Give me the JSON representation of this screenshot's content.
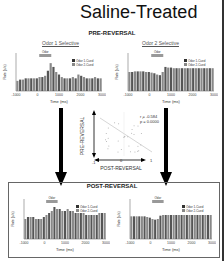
{
  "title": "Saline-Treated",
  "pre": {
    "label": "PRE-REVERSAL",
    "left_title": "Odor 1 Selective",
    "right_title": "Odor 2 Selective"
  },
  "post": {
    "label": "POST-REVERSAL"
  },
  "legend": {
    "odor": "Odor",
    "s1": "Odor 1-Cued",
    "s2": "Odor 2-Cued"
  },
  "axes": {
    "ylabel": "Rate (s/s)",
    "xlabel": "Time (ms)",
    "xticks": [
      "-1000",
      "0",
      "1000",
      "2000",
      "3000"
    ]
  },
  "scatter": {
    "r": "r = -0.584",
    "p": "p = 0.0000",
    "ylabel": "PRE-REVERSAL",
    "xlabel": "POST-REVERSAL",
    "xticks": [
      "-1",
      "0",
      "1"
    ],
    "yticks": [
      "1",
      "0",
      "-1"
    ]
  },
  "chart_data": [
    {
      "type": "bar",
      "title": "Pre-Reversal Odor 1 Selective",
      "xlabel": "Time (ms)",
      "ylabel": "Rate (s/s)",
      "xlim": [
        -1000,
        3000
      ],
      "ylim": [
        0,
        3
      ],
      "series": [
        {
          "name": "Odor 1-Cued",
          "values": [
            0.8,
            0.9,
            0.9,
            1,
            1,
            1,
            1,
            1,
            1.1,
            1.1,
            1.2,
            1.6,
            2.2,
            1.9,
            1.5,
            1.3,
            1.1,
            1,
            1,
            1,
            1.1,
            1,
            1.3,
            1.2,
            1.1,
            1,
            1,
            1,
            1.1,
            1,
            1
          ]
        }
      ]
    },
    {
      "type": "bar",
      "title": "Pre-Reversal Odor 2 Selective",
      "xlabel": "Time (ms)",
      "ylabel": "Rate (s/s)",
      "xlim": [
        -1000,
        3000
      ],
      "ylim": [
        0,
        6
      ],
      "series": [
        {
          "name": "Odor 2-Cued",
          "values": [
            3,
            3,
            3.1,
            3.1,
            3.1,
            3.1,
            3,
            3,
            2.9,
            2.8,
            2.6,
            2.5,
            3,
            3.8,
            3.7,
            3.7,
            3.6,
            3.6,
            3.6,
            3.6,
            3.6,
            3.6,
            3.6,
            3.6,
            3.6,
            3.6,
            3.6,
            3.6,
            3.6,
            3.6,
            3.6
          ]
        }
      ]
    },
    {
      "type": "bar",
      "title": "Post-Reversal Odor 1 Selective",
      "xlabel": "Time (ms)",
      "ylabel": "Rate (s/s)",
      "xlim": [
        -1000,
        3000
      ],
      "ylim": [
        0,
        2
      ],
      "series": [
        {
          "name": "Odor 1-Cued",
          "values": [
            1,
            1.1,
            1.1,
            1.1,
            1,
            1,
            1,
            1.1,
            1.2,
            1.3,
            1.4,
            1.6,
            1.5,
            1.5,
            1.4,
            1.4,
            1.5,
            1.4,
            1.4,
            1.3,
            1.3,
            1.3,
            1.3,
            1.2,
            1.2,
            1.2,
            1.2,
            1.2,
            1.3,
            1.3,
            1.3
          ]
        }
      ]
    },
    {
      "type": "bar",
      "title": "Post-Reversal Odor 2 Selective",
      "xlabel": "Time (ms)",
      "ylabel": "Rate (s/s)",
      "xlim": [
        -1000,
        3000
      ],
      "ylim": [
        0,
        6
      ],
      "series": [
        {
          "name": "Odor 2-Cued",
          "values": [
            3.4,
            3.4,
            3.4,
            3.4,
            3.4,
            3.4,
            3.3,
            3.2,
            3,
            2.9,
            3,
            3.5,
            3.6,
            3.6,
            3.6,
            3.6,
            3.6,
            3.6,
            3.6,
            3.6,
            3.6,
            3.6,
            3.6,
            3.6,
            3.6,
            3.6,
            3.6,
            3.6,
            3.6,
            3.6,
            3.6
          ]
        }
      ]
    },
    {
      "type": "scatter",
      "title": "Selectivity correlation",
      "xlabel": "POST-REVERSAL",
      "ylabel": "PRE-REVERSAL",
      "xlim": [
        -1,
        1
      ],
      "ylim": [
        -1,
        1
      ],
      "annotations": [
        "r = -0.584",
        "p = 0.0000"
      ]
    }
  ]
}
